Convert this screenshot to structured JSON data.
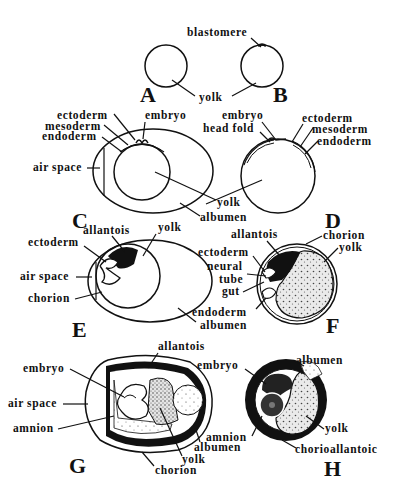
{
  "diagram": {
    "panels": [
      {
        "id": "A",
        "letter": "A",
        "labels": [
          "yolk"
        ]
      },
      {
        "id": "B",
        "letter": "B",
        "labels": [
          "blastomere",
          "yolk"
        ]
      },
      {
        "id": "C",
        "letter": "C",
        "labels": [
          "ectoderm",
          "mesoderm",
          "endoderm",
          "embryo",
          "air space",
          "yolk",
          "albumen"
        ]
      },
      {
        "id": "D",
        "letter": "D",
        "labels": [
          "embryo",
          "head fold",
          "ectoderm",
          "mesoderm",
          "endoderm"
        ]
      },
      {
        "id": "E",
        "letter": "E",
        "labels": [
          "allantois",
          "yolk",
          "ectoderm",
          "air space",
          "chorion",
          "endoderm",
          "albumen"
        ]
      },
      {
        "id": "F",
        "letter": "F",
        "labels": [
          "allantois",
          "chorion",
          "yolk",
          "ectoderm",
          "neural",
          "tube",
          "gut"
        ]
      },
      {
        "id": "G",
        "letter": "G",
        "labels": [
          "allantois",
          "embryo",
          "air space",
          "amnion",
          "albumen",
          "yolk",
          "chorion"
        ]
      },
      {
        "id": "H",
        "letter": "H",
        "labels": [
          "embryo",
          "albumen",
          "amnion",
          "yolk",
          "chorioallantoic"
        ]
      }
    ],
    "text": {
      "blastomere": "blastomere",
      "yolk": "yolk",
      "ectoderm": "ectoderm",
      "mesoderm": "mesoderm",
      "endoderm": "endoderm",
      "embryo": "embryo",
      "head_fold": "head fold",
      "air_space": "air space",
      "albumen": "albumen",
      "allantois": "allantois",
      "chorion": "chorion",
      "neural": "neural",
      "tube": "tube",
      "gut": "gut",
      "amnion": "amnion",
      "chorioallantoic": "chorioallantoic",
      "A": "A",
      "B": "B",
      "C": "C",
      "D": "D",
      "E": "E",
      "F": "F",
      "G": "G",
      "H": "H"
    }
  }
}
